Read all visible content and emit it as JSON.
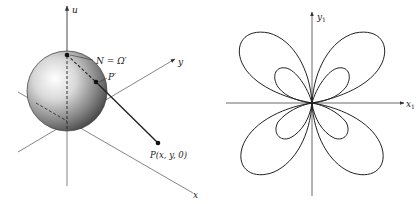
{
  "left_diagram": {
    "description": "Stereographic projection from sphere",
    "axes": {
      "u": "u",
      "x": "x",
      "y": "y"
    },
    "points": {
      "north": "N = Ω′",
      "projected": "P′",
      "plane_point": "P(x, y, 0)"
    },
    "colors": {
      "sphere_highlight": "#ffffff",
      "sphere_shadow": "#3a3a3a",
      "lines": "#555555"
    }
  },
  "right_diagram": {
    "description": "Butterfly-shaped four-lobed curve with inner loops",
    "axes": {
      "x": "x",
      "x_sub": "1",
      "y": "y",
      "y_sub": "1"
    },
    "colors": {
      "curve": "#222222",
      "axes": "#444444"
    }
  }
}
